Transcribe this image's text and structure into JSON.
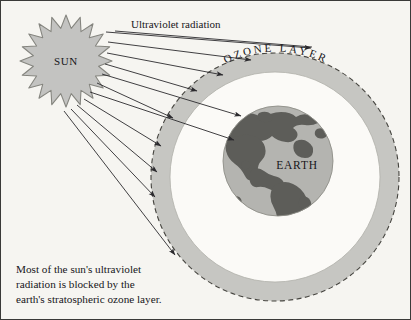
{
  "diagram": {
    "title_label": "Ultraviolet radiation",
    "sun_label": "SUN",
    "earth_label": "EARTH",
    "ozone_label": "OZONE LAYER",
    "caption_lines": [
      "Most of the sun's ultraviolet",
      "radiation is blocked by the",
      "earth's stratospheric ozone layer."
    ],
    "colors": {
      "background": "#f6f5f1",
      "frame": "#3a3a38",
      "sun_fill": "#c3c3c1",
      "sun_stroke": "#85857f",
      "ozone_fill": "#c6c6c2",
      "ozone_dash": "#45443f",
      "gap_fill": "#fbfaf7",
      "earth_ocean": "#b4b4b0",
      "earth_land": "#5d5d59",
      "ray": "#2b2a2e",
      "text": "#17161a"
    },
    "geometry": {
      "sun_center": [
        65,
        60
      ],
      "sun_outer_radius": 46,
      "sun_inner_radius": 33,
      "sun_points": 20,
      "ozone_center": [
        274,
        176
      ],
      "ozone_outer_radius": 124,
      "ozone_inner_radius": 105,
      "earth_center": [
        277,
        160
      ],
      "earth_radius": 55,
      "ray_count": 11
    },
    "rays": [
      {
        "x1": 105,
        "y1": 31,
        "x2": 310,
        "y2": 47,
        "name": "ray-1-top"
      },
      {
        "x1": 107,
        "y1": 41,
        "x2": 250,
        "y2": 59,
        "name": "ray-2"
      },
      {
        "x1": 106,
        "y1": 52,
        "x2": 222,
        "y2": 74,
        "name": "ray-3"
      },
      {
        "x1": 104,
        "y1": 63,
        "x2": 196,
        "y2": 90,
        "name": "ray-4"
      },
      {
        "x1": 101,
        "y1": 73,
        "x2": 240,
        "y2": 115,
        "name": "ray-5-through"
      },
      {
        "x1": 96,
        "y1": 82,
        "x2": 172,
        "y2": 117,
        "name": "ray-6"
      },
      {
        "x1": 89,
        "y1": 91,
        "x2": 233,
        "y2": 139,
        "name": "ray-7-through"
      },
      {
        "x1": 83,
        "y1": 98,
        "x2": 160,
        "y2": 145,
        "name": "ray-8"
      },
      {
        "x1": 76,
        "y1": 104,
        "x2": 156,
        "y2": 171,
        "name": "ray-9"
      },
      {
        "x1": 70,
        "y1": 108,
        "x2": 154,
        "y2": 196,
        "name": "ray-10"
      },
      {
        "x1": 63,
        "y1": 110,
        "x2": 174,
        "y2": 254,
        "name": "ray-11-bottom"
      }
    ],
    "uv_underline": {
      "x1": 114,
      "y1": 30,
      "x2": 311,
      "y2": 46
    }
  }
}
